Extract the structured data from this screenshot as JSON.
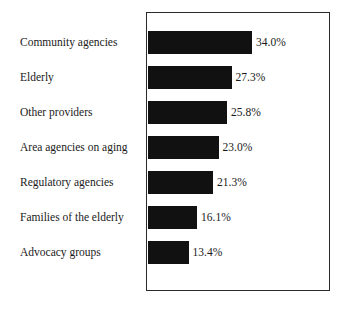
{
  "chart_data": {
    "type": "bar",
    "orientation": "horizontal",
    "title": "",
    "subtitle": "",
    "xlabel": "",
    "ylabel": "",
    "grid": false,
    "legend": null,
    "xlim": [
      0,
      40
    ],
    "axis_ticks": [],
    "value_suffix": "%",
    "categories": [
      "Community agencies",
      "Elderly",
      "Other providers",
      "Area agencies on aging",
      "Regulatory agencies",
      "Families of the elderly",
      "Advocacy groups"
    ],
    "values": [
      34.0,
      27.3,
      25.8,
      23.0,
      21.3,
      16.1,
      13.4
    ],
    "value_labels": [
      "34.0%",
      "27.3%",
      "25.8%",
      "23.0%",
      "21.3%",
      "16.1%",
      "13.4%"
    ],
    "bar_color": "#111111",
    "frame_color": "#2a2a2a",
    "background_color": "#ffffff"
  },
  "layout": {
    "bar_height_px": 23,
    "row_tops_px": [
      31,
      66,
      101,
      136,
      171,
      206,
      241
    ],
    "bar_widths_px": [
      104.5,
      84.0,
      79.5,
      71.0,
      65.5,
      49.5,
      41.0
    ],
    "plot_left_px": 146,
    "plot_top_px": 12,
    "plot_width_px": 184,
    "plot_height_px": 279
  }
}
